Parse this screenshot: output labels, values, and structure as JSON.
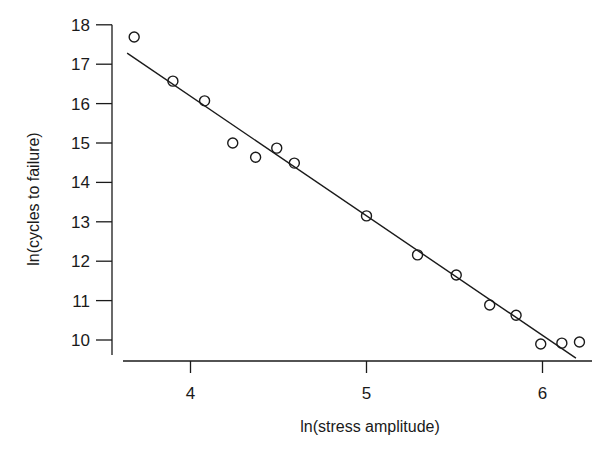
{
  "chart_data": {
    "type": "scatter",
    "title": "",
    "xlabel": "ln(stress amplitude)",
    "ylabel": "ln(cycles to failure)",
    "xlim": [
      3.6,
      6.35
    ],
    "ylim": [
      9.6,
      18.0
    ],
    "x_ticks": [
      4,
      5,
      6
    ],
    "x_tick_labels": [
      "4",
      "5",
      "6"
    ],
    "y_ticks": [
      10,
      11,
      12,
      13,
      14,
      15,
      16,
      17,
      18
    ],
    "y_tick_labels": [
      "10",
      "11",
      "12",
      "13",
      "14",
      "15",
      "16",
      "17",
      "18"
    ],
    "grid": false,
    "legend": null,
    "series": [
      {
        "name": "observations",
        "marker": "open-circle",
        "x": [
          3.68,
          3.9,
          4.08,
          4.24,
          4.37,
          4.49,
          4.59,
          5.0,
          5.29,
          5.51,
          5.7,
          5.85,
          5.99,
          6.11,
          6.21
        ],
        "y": [
          17.69,
          16.57,
          16.07,
          15.0,
          14.64,
          14.87,
          14.49,
          13.15,
          12.16,
          11.65,
          10.89,
          10.63,
          9.9,
          9.92,
          9.95
        ]
      },
      {
        "name": "fitted regression line",
        "marker": "line",
        "x": [
          3.64,
          6.19
        ],
        "y": [
          17.28,
          9.54
        ]
      }
    ]
  }
}
